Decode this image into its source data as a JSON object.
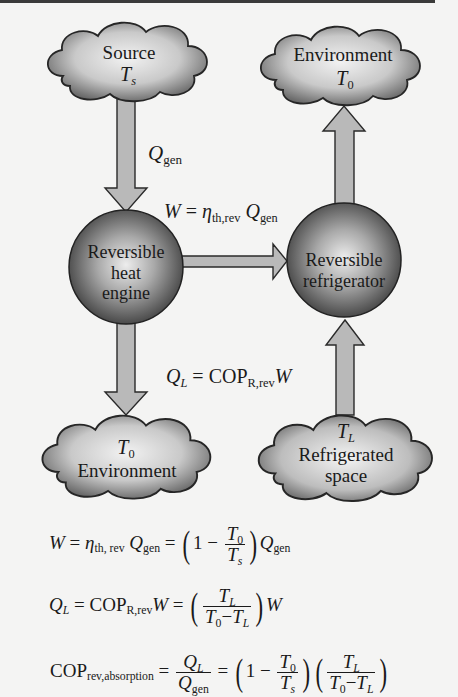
{
  "diagram": {
    "nodes": {
      "source": {
        "label": "Source",
        "temp": "T",
        "temp_sub": "s"
      },
      "environment_top": {
        "label": "Environment",
        "temp": "T",
        "temp_sub": "0"
      },
      "heat_engine": {
        "line1": "Reversible",
        "line2": "heat",
        "line3": "engine"
      },
      "refrigerator": {
        "line1": "Reversible",
        "line2": "refrigerator"
      },
      "environment_bottom": {
        "label": "Environment",
        "temp": "T",
        "temp_sub": "0"
      },
      "refrigerated_space": {
        "line1": "Refrigerated",
        "line2": "space",
        "temp": "T",
        "temp_sub": "L"
      }
    },
    "arrows": {
      "q_gen": {
        "symbol": "Q",
        "sub": "gen"
      },
      "work": {
        "lhs": "W",
        "eq": " = ",
        "eta": "η",
        "eta_sub": "th,rev",
        "q": " Q",
        "q_sub": "gen"
      },
      "q_l": {
        "lhs": "Q",
        "lhs_sub": "L",
        "eq": " = COP",
        "cop_sub": "R,rev",
        "w": "W"
      }
    }
  },
  "equations": {
    "eq1": {
      "lhs": "W",
      "eq": " = ",
      "eta": "η",
      "eta_sub": "th, rev",
      "q": " Q",
      "q_sub": "gen",
      "eq2": " = ",
      "one_minus": "1 − ",
      "num": "T",
      "num_sub": "0",
      "den": "T",
      "den_sub": "s",
      "q2": "Q",
      "q2_sub": "gen"
    },
    "eq2": {
      "lhs": "Q",
      "lhs_sub": "L",
      "eq": " = COP",
      "cop_sub": "R,rev",
      "w": "W",
      "eq2": " = ",
      "num": "T",
      "num_sub": "L",
      "den_a": "T",
      "den_a_sub": "0",
      "den_minus": "−",
      "den_b": "T",
      "den_b_sub": "L",
      "w2": "W"
    },
    "eq3": {
      "lhs": "COP",
      "lhs_sub": "rev,absorption",
      "eq": " = ",
      "num": "Q",
      "num_sub": "L",
      "den": "Q",
      "den_sub": "gen",
      "eq2": " = ",
      "one_minus": "1 − ",
      "f1_num": "T",
      "f1_num_sub": "0",
      "f1_den": "T",
      "f1_den_sub": "s",
      "f2_num": "T",
      "f2_num_sub": "L",
      "f2_den_a": "T",
      "f2_den_a_sub": "0",
      "f2_den_minus": "−",
      "f2_den_b": "T",
      "f2_den_b_sub": "L"
    }
  },
  "colors": {
    "background": "#f4f4f3",
    "arrow_fill": "#b9b9b9",
    "outline": "#2a2a2a",
    "cloud_light": "#ececec",
    "cloud_dark": "#6e6e6e",
    "sphere_light": "#e2e2e2",
    "sphere_dark": "#4a4a4a"
  }
}
